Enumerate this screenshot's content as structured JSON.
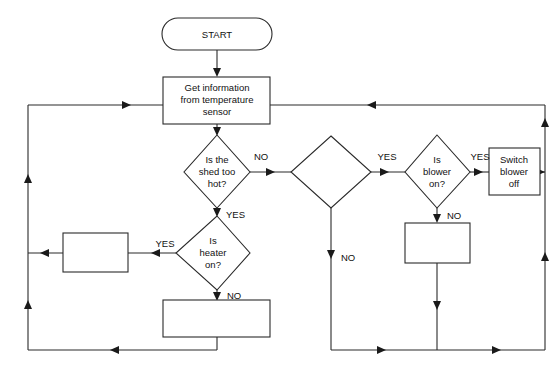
{
  "diagram": {
    "width": 559,
    "height": 370,
    "background_color": "#ffffff",
    "line_color": "#2a2a2a",
    "text_color": "#111111"
  },
  "nodes": {
    "start": {
      "type": "terminator",
      "label": "START"
    },
    "get_info": {
      "type": "process",
      "label_line_1": "Get information",
      "label_line_2": "from temperature",
      "label_line_3": "sensor"
    },
    "shed_hot": {
      "type": "decision",
      "label_line_1": "Is the",
      "label_line_2": "shed too",
      "label_line_3": "hot?"
    },
    "heater_on": {
      "type": "decision",
      "label_line_1": "Is",
      "label_line_2": "heater",
      "label_line_3": "on?"
    },
    "blank_decision": {
      "type": "decision",
      "label": ""
    },
    "blower_on": {
      "type": "decision",
      "label_line_1": "Is",
      "label_line_2": "blower",
      "label_line_3": "on?"
    },
    "switch_blower_off": {
      "type": "process",
      "label_line_1": "Switch",
      "label_line_2": "blower",
      "label_line_3": "off"
    },
    "blank_process_left": {
      "type": "process",
      "label": ""
    },
    "blank_process_bottom": {
      "type": "process",
      "label": ""
    },
    "blank_process_right": {
      "type": "process",
      "label": ""
    }
  },
  "edge_labels": {
    "shed_hot_no": "NO",
    "shed_hot_yes": "YES",
    "heater_on_yes": "YES",
    "heater_on_no": "NO",
    "blank_decision_yes": "YES",
    "blank_decision_no": "NO",
    "blower_on_yes": "YES",
    "blower_on_no": "NO"
  }
}
